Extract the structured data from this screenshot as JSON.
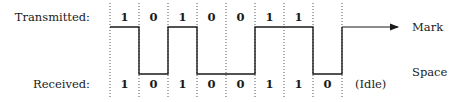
{
  "diagram": {
    "row_labels": {
      "transmitted": "Transmitted:",
      "received": "Received:"
    },
    "level_labels": {
      "mark": "Mark",
      "space": "Space"
    },
    "idle_label": "(Idle)",
    "transmitted_bits": [
      "1",
      "0",
      "1",
      "0",
      "0",
      "1",
      "1"
    ],
    "received_bits": [
      "1",
      "0",
      "1",
      "0",
      "0",
      "1",
      "1",
      "0"
    ],
    "waveform_levels": [
      1,
      0,
      1,
      0,
      0,
      1,
      1,
      0,
      1
    ],
    "colors": {
      "line": "#1a1a1a",
      "grid": "#555555",
      "background": "#ffffff"
    }
  }
}
